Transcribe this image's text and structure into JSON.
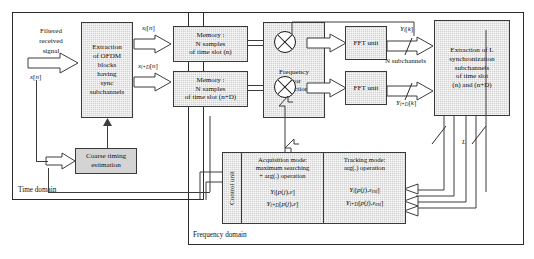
{
  "diagram": {
    "regions": [
      {
        "name": "time-domain",
        "label": "Time domain"
      },
      {
        "name": "frequency-domain",
        "label": "Frequency domain"
      }
    ],
    "blocks": {
      "extraction_ofdm": "Extraction\nof OFDM\nblocks\nhaving\nsync\nsubchannels",
      "memory_n": "Memory :\nN samples\nof time slot (n)",
      "memory_nd": "Memory :\nN samples\nof time slot (n+D)",
      "freq_err": "Frequency\nerror\ncorrection",
      "fft_top": "FFT unit",
      "fft_bottom": "FFT unit",
      "extraction_l": "Extraction of L\nsynchronization\nsubchannels\nof time slot\n(n) and (n+D)",
      "coarse_timing": "Coarse timing\nestimation",
      "control_unit": "Control unit"
    },
    "control_modes": {
      "acquisition_title": "Acquisition mode:\nmaximum searching\n+ arg(.) operation",
      "tracking_title": "Tracking mode:\narg(.) operation",
      "acquisition_formula_1": "Y i [ p( j ), ε ]",
      "acquisition_formula_2": "Y i+D [ p( j ), ε ]",
      "tracking_formula_1": "Y i [ p( j ), ε est ]",
      "tracking_formula_2": "Y i+D [ p( j ), ε est ]"
    },
    "signals": {
      "filtered_received": "Filtered\nreceived\nsignal",
      "x_n": "x[n]",
      "x_i_n": "x i [n]",
      "x_id_n": "x i+D [n]",
      "y_i_k": "Y i [k]",
      "y_id_k": "Y i+D [k]",
      "n_subchannels": "N subchannels",
      "l_bus": "L"
    },
    "colors": {
      "box_fill": "#d2d2d2",
      "line": "#3d3d3d",
      "border": "#2b2b2b",
      "text": "#111111"
    }
  }
}
